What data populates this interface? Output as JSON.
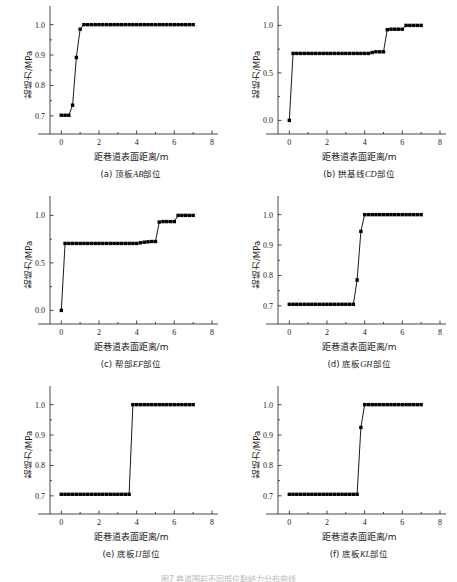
{
  "figure": {
    "axis_labels": {
      "x": "距巷道表面距离/m",
      "y": "黏结力/MPa"
    },
    "bottom_caption": "图7 巷道围岩不同部位黏结力分布曲线"
  },
  "chart_data": [
    {
      "type": "line",
      "panel": "a",
      "title": "(a) 顶板AB部位",
      "caption_prefix": "(a) 顶板",
      "caption_italic": "AB",
      "caption_suffix": "部位",
      "xlabel": "距巷道表面距离/m",
      "ylabel": "黏结力/MPa",
      "xlim": [
        -0.6,
        8.0
      ],
      "ylim": [
        0.66,
        1.035
      ],
      "xticks": [
        0,
        2,
        4,
        6,
        8
      ],
      "xticklabels": [
        "0",
        "2",
        "4",
        "6",
        "8"
      ],
      "xminorticks": [
        1,
        3,
        5,
        7
      ],
      "yticks": [
        0.7,
        0.8,
        0.9,
        1.0
      ],
      "yticklabels": [
        "0.7",
        "0.8",
        "0.9",
        "1.0"
      ],
      "yminorticks": [
        0.75,
        0.85,
        0.95
      ],
      "grid": false,
      "legend": "none",
      "x": [
        0.0,
        0.2,
        0.4,
        0.6,
        0.8,
        1.0,
        1.2,
        1.4,
        1.6,
        1.8,
        2.0,
        2.2,
        2.4,
        2.6,
        2.8,
        3.0,
        3.2,
        3.4,
        3.6,
        3.8,
        4.0,
        4.2,
        4.4,
        4.6,
        4.8,
        5.0,
        5.2,
        5.4,
        5.6,
        5.8,
        6.0,
        6.2,
        6.4,
        6.6,
        6.8,
        7.0
      ],
      "y": [
        0.702,
        0.702,
        0.702,
        0.735,
        0.892,
        0.985,
        1.0,
        1.0,
        1.0,
        1.0,
        1.0,
        1.0,
        1.0,
        1.0,
        1.0,
        1.0,
        1.0,
        1.0,
        1.0,
        1.0,
        1.0,
        1.0,
        1.0,
        1.0,
        1.0,
        1.0,
        1.0,
        1.0,
        1.0,
        1.0,
        1.0,
        1.0,
        1.0,
        1.0,
        1.0,
        1.0
      ]
    },
    {
      "type": "line",
      "panel": "b",
      "title": "(b) 拱基线CD部位",
      "caption_prefix": "(b) 拱基线",
      "caption_italic": "CD",
      "caption_suffix": "部位",
      "xlabel": "距巷道表面距离/m",
      "ylabel": "黏结力/MPa",
      "xlim": [
        -0.6,
        8.0
      ],
      "ylim": [
        -0.08,
        1.12
      ],
      "xticks": [
        0,
        2,
        4,
        6,
        8
      ],
      "xticklabels": [
        "0",
        "2",
        "4",
        "6",
        "8"
      ],
      "xminorticks": [
        1,
        3,
        5,
        7
      ],
      "yticks": [
        0.0,
        0.5,
        1.0
      ],
      "yticklabels": [
        "0.0",
        "0.5",
        "1.0"
      ],
      "yminorticks": [
        0.25,
        0.75
      ],
      "grid": false,
      "legend": "none",
      "x": [
        0.0,
        0.2,
        0.4,
        0.6,
        0.8,
        1.0,
        1.2,
        1.4,
        1.6,
        1.8,
        2.0,
        2.2,
        2.4,
        2.6,
        2.8,
        3.0,
        3.2,
        3.4,
        3.6,
        3.8,
        4.0,
        4.2,
        4.4,
        4.6,
        4.8,
        5.0,
        5.2,
        5.4,
        5.6,
        5.8,
        6.0,
        6.2,
        6.4,
        6.6,
        6.8,
        7.0
      ],
      "y": [
        0.0,
        0.705,
        0.705,
        0.705,
        0.705,
        0.705,
        0.705,
        0.705,
        0.705,
        0.705,
        0.705,
        0.705,
        0.705,
        0.705,
        0.705,
        0.705,
        0.705,
        0.705,
        0.705,
        0.705,
        0.705,
        0.705,
        0.715,
        0.722,
        0.722,
        0.722,
        0.955,
        0.96,
        0.96,
        0.96,
        0.96,
        1.0,
        1.0,
        1.0,
        1.0,
        1.0
      ]
    },
    {
      "type": "line",
      "panel": "c",
      "title": "(c) 帮部EF部位",
      "caption_prefix": "(c) 帮部",
      "caption_italic": "EF",
      "caption_suffix": "部位",
      "xlabel": "距巷道表面距离/m",
      "ylabel": "黏结力/MPa",
      "xlim": [
        -0.6,
        8.0
      ],
      "ylim": [
        -0.08,
        1.12
      ],
      "xticks": [
        0,
        2,
        4,
        6,
        8
      ],
      "xticklabels": [
        "0",
        "2",
        "4",
        "6",
        "8"
      ],
      "xminorticks": [
        1,
        3,
        5,
        7
      ],
      "yticks": [
        0.0,
        0.5,
        1.0
      ],
      "yticklabels": [
        "0.0",
        "0.5",
        "1.0"
      ],
      "yminorticks": [
        0.25,
        0.75
      ],
      "grid": false,
      "legend": "none",
      "x": [
        0.0,
        0.2,
        0.4,
        0.6,
        0.8,
        1.0,
        1.2,
        1.4,
        1.6,
        1.8,
        2.0,
        2.2,
        2.4,
        2.6,
        2.8,
        3.0,
        3.2,
        3.4,
        3.6,
        3.8,
        4.0,
        4.2,
        4.4,
        4.6,
        4.8,
        5.0,
        5.2,
        5.4,
        5.6,
        5.8,
        6.0,
        6.2,
        6.4,
        6.6,
        6.8,
        7.0
      ],
      "y": [
        0.0,
        0.705,
        0.705,
        0.705,
        0.705,
        0.705,
        0.705,
        0.705,
        0.705,
        0.705,
        0.705,
        0.705,
        0.705,
        0.705,
        0.705,
        0.705,
        0.705,
        0.705,
        0.705,
        0.705,
        0.705,
        0.712,
        0.718,
        0.722,
        0.725,
        0.725,
        0.93,
        0.935,
        0.935,
        0.935,
        0.935,
        1.0,
        1.0,
        1.0,
        1.0,
        1.0
      ]
    },
    {
      "type": "line",
      "panel": "d",
      "title": "(d) 底板GH部位",
      "caption_prefix": "(d) 底板",
      "caption_italic": "GH",
      "caption_suffix": "部位",
      "xlabel": "距巷道表面距离/m",
      "ylabel": "黏结力/MPa",
      "xlim": [
        -0.6,
        8.0
      ],
      "ylim": [
        0.66,
        1.035
      ],
      "xticks": [
        0,
        2,
        4,
        6,
        8
      ],
      "xticklabels": [
        "0",
        "2",
        "4",
        "6",
        "8"
      ],
      "xminorticks": [
        1,
        3,
        5,
        7
      ],
      "yticks": [
        0.7,
        0.8,
        0.9,
        1.0
      ],
      "yticklabels": [
        "0.7",
        "0.8",
        "0.9",
        "1.0"
      ],
      "yminorticks": [
        0.75,
        0.85,
        0.95
      ],
      "grid": false,
      "legend": "none",
      "x": [
        0.0,
        0.2,
        0.4,
        0.6,
        0.8,
        1.0,
        1.2,
        1.4,
        1.6,
        1.8,
        2.0,
        2.2,
        2.4,
        2.6,
        2.8,
        3.0,
        3.2,
        3.4,
        3.6,
        3.8,
        4.0,
        4.2,
        4.4,
        4.6,
        4.8,
        5.0,
        5.2,
        5.4,
        5.6,
        5.8,
        6.0,
        6.2,
        6.4,
        6.6,
        6.8,
        7.0
      ],
      "y": [
        0.705,
        0.705,
        0.705,
        0.705,
        0.705,
        0.705,
        0.705,
        0.705,
        0.705,
        0.705,
        0.705,
        0.705,
        0.705,
        0.705,
        0.705,
        0.705,
        0.705,
        0.705,
        0.785,
        0.945,
        1.0,
        1.0,
        1.0,
        1.0,
        1.0,
        1.0,
        1.0,
        1.0,
        1.0,
        1.0,
        1.0,
        1.0,
        1.0,
        1.0,
        1.0,
        1.0
      ]
    },
    {
      "type": "line",
      "panel": "e",
      "title": "(e) 底板IJ部位",
      "caption_prefix": "(e) 底板",
      "caption_italic": "IJ",
      "caption_suffix": "部位",
      "xlabel": "距巷道表面距离/m",
      "ylabel": "黏结力/MPa",
      "xlim": [
        -0.6,
        8.0
      ],
      "ylim": [
        0.66,
        1.035
      ],
      "xticks": [
        0,
        2,
        4,
        6,
        8
      ],
      "xticklabels": [
        "0",
        "2",
        "4",
        "6",
        "8"
      ],
      "xminorticks": [
        1,
        3,
        5,
        7
      ],
      "yticks": [
        0.7,
        0.8,
        0.9,
        1.0
      ],
      "yticklabels": [
        "0.7",
        "0.8",
        "0.9",
        "1.0"
      ],
      "yminorticks": [
        0.75,
        0.85,
        0.95
      ],
      "grid": false,
      "legend": "none",
      "x": [
        0.0,
        0.2,
        0.4,
        0.6,
        0.8,
        1.0,
        1.2,
        1.4,
        1.6,
        1.8,
        2.0,
        2.2,
        2.4,
        2.6,
        2.8,
        3.0,
        3.2,
        3.4,
        3.6,
        3.8,
        4.0,
        4.2,
        4.4,
        4.6,
        4.8,
        5.0,
        5.2,
        5.4,
        5.6,
        5.8,
        6.0,
        6.2,
        6.4,
        6.6,
        6.8,
        7.0
      ],
      "y": [
        0.705,
        0.705,
        0.705,
        0.705,
        0.705,
        0.705,
        0.705,
        0.705,
        0.705,
        0.705,
        0.705,
        0.705,
        0.705,
        0.705,
        0.705,
        0.705,
        0.705,
        0.705,
        0.705,
        1.0,
        1.0,
        1.0,
        1.0,
        1.0,
        1.0,
        1.0,
        1.0,
        1.0,
        1.0,
        1.0,
        1.0,
        1.0,
        1.0,
        1.0,
        1.0,
        1.0
      ]
    },
    {
      "type": "line",
      "panel": "f",
      "title": "(f) 底板KL部位",
      "caption_prefix": "(f) 底板",
      "caption_italic": "KL",
      "caption_suffix": "部位",
      "xlabel": "距巷道表面距离/m",
      "ylabel": "黏结力/MPa",
      "xlim": [
        -0.6,
        8.0
      ],
      "ylim": [
        0.66,
        1.035
      ],
      "xticks": [
        0,
        2,
        4,
        6,
        8
      ],
      "xticklabels": [
        "0",
        "2",
        "4",
        "6",
        "8"
      ],
      "xminorticks": [
        1,
        3,
        5,
        7
      ],
      "yticks": [
        0.7,
        0.8,
        0.9,
        1.0
      ],
      "yticklabels": [
        "0.7",
        "0.8",
        "0.9",
        "1.0"
      ],
      "yminorticks": [
        0.75,
        0.85,
        0.95
      ],
      "grid": false,
      "legend": "none",
      "x": [
        0.0,
        0.2,
        0.4,
        0.6,
        0.8,
        1.0,
        1.2,
        1.4,
        1.6,
        1.8,
        2.0,
        2.2,
        2.4,
        2.6,
        2.8,
        3.0,
        3.2,
        3.4,
        3.6,
        3.8,
        4.0,
        4.2,
        4.4,
        4.6,
        4.8,
        5.0,
        5.2,
        5.4,
        5.6,
        5.8,
        6.0,
        6.2,
        6.4,
        6.6,
        6.8,
        7.0
      ],
      "y": [
        0.705,
        0.705,
        0.705,
        0.705,
        0.705,
        0.705,
        0.705,
        0.705,
        0.705,
        0.705,
        0.705,
        0.705,
        0.705,
        0.705,
        0.705,
        0.705,
        0.705,
        0.705,
        0.705,
        0.925,
        1.0,
        1.0,
        1.0,
        1.0,
        1.0,
        1.0,
        1.0,
        1.0,
        1.0,
        1.0,
        1.0,
        1.0,
        1.0,
        1.0,
        1.0,
        1.0
      ]
    }
  ]
}
